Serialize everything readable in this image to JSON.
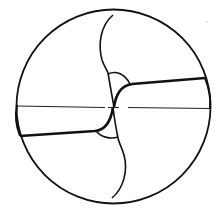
{
  "diagram": {
    "subject": "Twist drill end view (cross-section)",
    "colors": {
      "background": "#ffffff",
      "stroke": "#111111"
    },
    "elements": [
      {
        "name": "outer-circle",
        "label": "Drill body outline"
      },
      {
        "name": "center-axis",
        "label": "Dashed center line"
      },
      {
        "name": "upper-land",
        "label": "Upper margin / land"
      },
      {
        "name": "lower-land",
        "label": "Lower margin / land"
      },
      {
        "name": "upper-cutting-lip",
        "label": "Upper lip curve"
      },
      {
        "name": "lower-cutting-lip",
        "label": "Lower lip curve"
      },
      {
        "name": "chisel-edge",
        "label": "Chisel edge at web center"
      }
    ]
  }
}
